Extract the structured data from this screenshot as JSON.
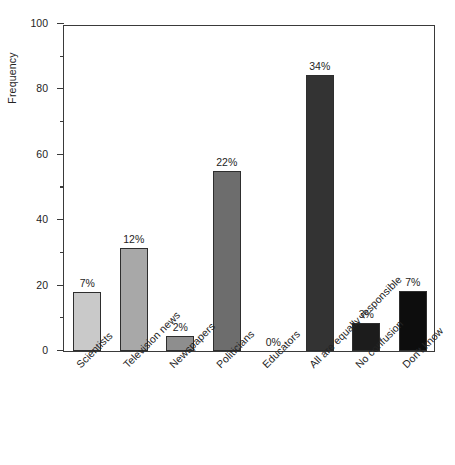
{
  "chart_data": {
    "type": "bar",
    "title": "",
    "subtitle": "",
    "xlabel": "",
    "ylabel": "Frequency",
    "ylim": [
      0,
      100
    ],
    "ytick_labels": [
      "0",
      "20",
      "40",
      "60",
      "80",
      "100"
    ],
    "ytick_values": [
      0,
      20,
      40,
      60,
      80,
      100
    ],
    "yminor_values": [
      10,
      30,
      50,
      70,
      90
    ],
    "grid": false,
    "legend": false,
    "legend_position": "none",
    "categories": [
      "Scientists",
      "Television news",
      "Newspapers",
      "Politicians",
      "Educators",
      "All are equally responsible",
      "No confusion",
      "Don't know"
    ],
    "values": [
      18,
      31.5,
      4.5,
      55,
      0,
      84.5,
      8.5,
      18.5
    ],
    "data_labels": [
      "7%",
      "12%",
      "2%",
      "22%",
      "0%",
      "34%",
      "3%",
      "7%"
    ],
    "bar_colors": [
      "#c9c9c9",
      "#a8a8a8",
      "#8e8e8e",
      "#6d6d6d",
      "#4f4f4f",
      "#333333",
      "#1c1c1c",
      "#0d0d0d"
    ],
    "bar_edge_color": "#2e2e2e",
    "axis_color": "#3a3a3a",
    "text_color": "#232323",
    "background": "#ffffff"
  }
}
